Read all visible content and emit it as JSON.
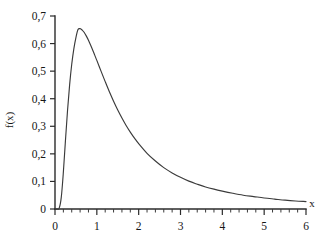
{
  "chart_data": {
    "type": "line",
    "title": "",
    "subtitle": "",
    "xlabel": "x",
    "ylabel": "f(x)",
    "xlim": [
      0,
      6
    ],
    "ylim": [
      0,
      0.7
    ],
    "grid": false,
    "legend": null,
    "legend_position": "none",
    "decimal_separator": ",",
    "x_ticks": [
      0,
      1,
      2,
      3,
      4,
      5,
      6
    ],
    "x_tick_labels": [
      "0",
      "1",
      "2",
      "3",
      "4",
      "5",
      "6"
    ],
    "x_minor_step": 0.2,
    "y_ticks": [
      0,
      0.1,
      0.2,
      0.3,
      0.4,
      0.5,
      0.6,
      0.7
    ],
    "y_tick_labels": [
      "0",
      "0,1",
      "0,2",
      "0,3",
      "0,4",
      "0,5",
      "0,6",
      "0,7"
    ],
    "y_minor_step": 0,
    "annotations": [],
    "series": [
      {
        "name": "f(x)",
        "color": "#3b3b3b",
        "peak_x": 0.55,
        "peak_y": 0.655,
        "x": [
          0,
          0.05,
          0.1,
          0.15,
          0.2,
          0.25,
          0.3,
          0.35,
          0.4,
          0.45,
          0.5,
          0.55,
          0.6,
          0.65,
          0.7,
          0.75,
          0.8,
          0.85,
          0.9,
          0.95,
          1,
          1.1,
          1.2,
          1.3,
          1.4,
          1.5,
          1.6,
          1.7,
          1.8,
          1.9,
          2,
          2.2,
          2.4,
          2.6,
          2.8,
          3,
          3.2,
          3.4,
          3.6,
          3.8,
          4,
          4.25,
          4.5,
          4.75,
          5,
          5.25,
          5.5,
          5.75,
          6
        ],
        "values": [
          0,
          0.0,
          0.003,
          0.042,
          0.134,
          0.249,
          0.358,
          0.451,
          0.525,
          0.581,
          0.622,
          0.651,
          0.654,
          0.649,
          0.64,
          0.627,
          0.612,
          0.595,
          0.577,
          0.558,
          0.539,
          0.5,
          0.462,
          0.425,
          0.391,
          0.359,
          0.33,
          0.303,
          0.279,
          0.257,
          0.237,
          0.202,
          0.174,
          0.15,
          0.131,
          0.115,
          0.101,
          0.09,
          0.08,
          0.072,
          0.065,
          0.057,
          0.05,
          0.045,
          0.04,
          0.036,
          0.032,
          0.029,
          0.027
        ]
      }
    ]
  },
  "axis": {
    "x_name": "x",
    "y_name": "f(x)"
  }
}
